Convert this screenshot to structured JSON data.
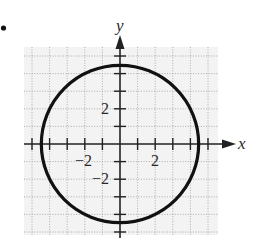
{
  "problem_marker": "•",
  "chart_data": {
    "type": "line",
    "title": "",
    "xlabel": "x",
    "ylabel": "y",
    "xlim": [
      -5,
      5
    ],
    "ylim": [
      -5,
      5
    ],
    "grid": true,
    "grid_style": "dotted",
    "tick_step": 1,
    "tick_labels": {
      "x": [
        {
          "value": -2,
          "label": "−2"
        },
        {
          "value": 2,
          "label": "2"
        }
      ],
      "y": [
        {
          "value": 2,
          "label": "2"
        },
        {
          "value": -2,
          "label": "−2"
        }
      ]
    },
    "series": [
      {
        "name": "circle",
        "shape": "circle",
        "center": [
          0,
          0
        ],
        "radius": 4.47,
        "equation": "x^2 + y^2 = 20"
      }
    ]
  },
  "colors": {
    "curve": "#111111",
    "axis": "#222222",
    "grid": "#9a9a9a",
    "grid_bg": "#f3f3f3"
  }
}
